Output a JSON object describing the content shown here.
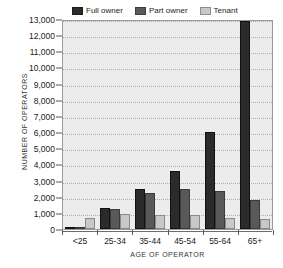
{
  "figure": {
    "cutoff_text": "· · ·",
    "legend": [
      {
        "label": "Full owner",
        "color": "#2b2b2b",
        "key": "full_owner"
      },
      {
        "label": "Part owner",
        "color": "#595959",
        "key": "part_owner"
      },
      {
        "label": "Tenant",
        "color": "#c8c8c8",
        "key": "tenant"
      }
    ],
    "y_axis_title": "NUMBER OF OPERATORS",
    "x_axis_title": "AGE OF OPERATOR",
    "y_tick_labels": [
      "13,000",
      "12,000",
      "11,000",
      "10,000",
      "9,000",
      "8,000",
      "7,000",
      "6,000",
      "5,000",
      "4,000",
      "3,000",
      "2,000",
      "1,000",
      "0"
    ]
  },
  "chart_data": {
    "type": "bar",
    "title": "",
    "xlabel": "AGE OF OPERATOR",
    "ylabel": "NUMBER OF OPERATORS",
    "categories": [
      "<25",
      "25-34",
      "35-44",
      "45-54",
      "55-64",
      "65+"
    ],
    "series": [
      {
        "name": "Full owner",
        "color": "#2b2b2b",
        "values": [
          150,
          1300,
          2500,
          3600,
          6000,
          12900
        ]
      },
      {
        "name": "Part owner",
        "color": "#595959",
        "values": [
          100,
          1250,
          2200,
          2500,
          2350,
          1800
        ]
      },
      {
        "name": "Tenant",
        "color": "#c8c8c8",
        "values": [
          700,
          900,
          850,
          850,
          700,
          650
        ]
      }
    ],
    "ylim": [
      0,
      13000
    ],
    "ytick_step": 1000,
    "grid": true,
    "legend_position": "top"
  }
}
